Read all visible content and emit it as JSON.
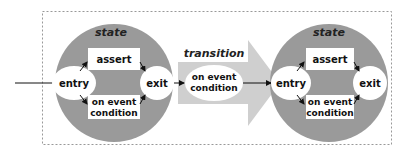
{
  "diagram": {
    "type": "state-transition",
    "colors": {
      "state_fill": "#9a9a9a",
      "transition_arrow_fill": "#cfcfcf",
      "box_fill": "#ffffff",
      "border": "#888888",
      "line": "#111111"
    },
    "states": [
      {
        "title": "state",
        "entry": "entry",
        "exit": "exit",
        "assert": "assert",
        "event_line1": "on event",
        "event_line2": "condition"
      },
      {
        "title": "state",
        "entry": "entry",
        "exit": "exit",
        "assert": "assert",
        "event_line1": "on event",
        "event_line2": "condition"
      }
    ],
    "transition": {
      "title": "transition",
      "event_line1": "on event",
      "event_line2": "condition"
    }
  }
}
